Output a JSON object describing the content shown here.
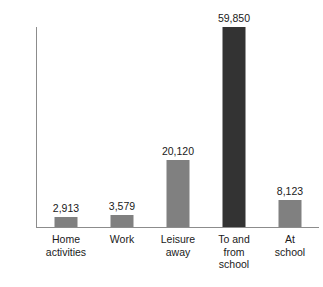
{
  "chart_data": {
    "type": "bar",
    "title": "",
    "xlabel": "",
    "ylabel": "Victimization per billion person-hours",
    "ylim": [
      0,
      59850
    ],
    "grid": false,
    "legend": "none",
    "categories": [
      "Home activities",
      "Work",
      "Leisure away",
      "To and from school",
      "At school"
    ],
    "category_lines": [
      [
        "Home",
        "activities"
      ],
      [
        "Work"
      ],
      [
        "Leisure",
        "away"
      ],
      [
        "To and",
        "from",
        "school"
      ],
      [
        "At",
        "school"
      ]
    ],
    "values": [
      2913,
      3579,
      20120,
      59850,
      8123
    ],
    "value_labels": [
      "2,913",
      "3,579",
      "20,120",
      "59,850",
      "8,123"
    ],
    "bar_colors": [
      "#808080",
      "#808080",
      "#808080",
      "#333333",
      "#808080"
    ],
    "highlight_category": "To and from school",
    "colors": {
      "bar_default": "#808080",
      "bar_highlight": "#333333",
      "axis": "#8c8c8c",
      "text": "#1a1a1a",
      "background": "#ffffff"
    }
  }
}
